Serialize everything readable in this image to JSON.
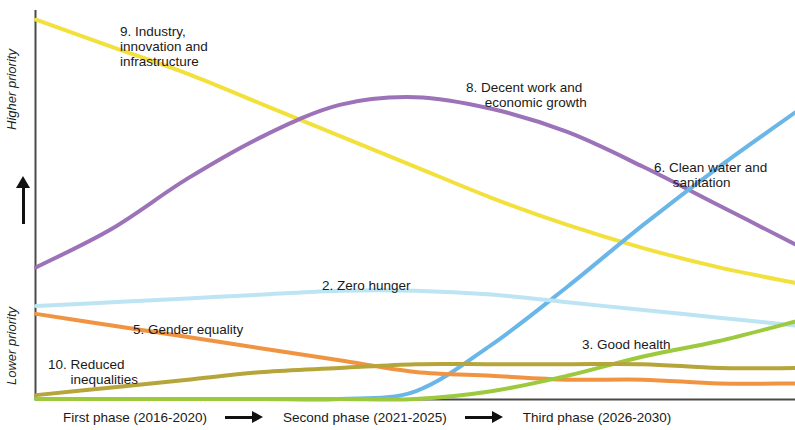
{
  "axes": {
    "y_high_label": "Higher priority",
    "y_low_label": "Lower priority",
    "y_arrow_icon": "up-arrow-icon",
    "phases": [
      {
        "label": "First phase (2016-2020)"
      },
      {
        "label": "Second phase (2021-2025)"
      },
      {
        "label": "Third phase (2026-2030)"
      }
    ],
    "phase_arrow_icon": "right-arrow-icon"
  },
  "labels": {
    "industry": "9. Industry,\ninnovation and\ninfrastructure",
    "decent_work": "8. Decent work and\n     economic growth",
    "clean_water": "6. Clean water and\n     sanitation",
    "zero_hunger": "2. Zero hunger",
    "gender_equality": "5. Gender equality",
    "good_health": "3. Good health",
    "reduced_inequalities": "10. Reduced\n      inequalities"
  },
  "chart_data": {
    "type": "line",
    "title": "",
    "xlabel": "",
    "ylabel": "Priority",
    "xlim": [
      0,
      100
    ],
    "ylim": [
      0,
      100
    ],
    "grid": false,
    "legend": "inline-annotations",
    "x_tick_labels": [
      "First phase (2016-2020)",
      "Second phase (2021-2025)",
      "Third phase (2026-2030)"
    ],
    "y_tick_labels": [
      "Lower priority",
      "Higher priority"
    ],
    "x": [
      0,
      10,
      20,
      30,
      40,
      50,
      60,
      70,
      80,
      90,
      100
    ],
    "series": [
      {
        "name": "9. Industry, innovation and infrastructure",
        "color": "#F2E13C",
        "values": [
          98,
          91,
          84,
          76,
          68,
          60,
          52,
          45,
          39,
          34,
          30
        ]
      },
      {
        "name": "8. Decent work and economic growth",
        "color": "#9C72B8",
        "values": [
          34,
          44,
          57,
          68,
          76,
          78,
          75,
          69,
          60,
          50,
          40
        ]
      },
      {
        "name": "6. Clean water and sanitation",
        "color": "#6BB6E8",
        "values": [
          0,
          0,
          0,
          0,
          0,
          2,
          14,
          29,
          45,
          60,
          74
        ]
      },
      {
        "name": "2. Zero hunger",
        "color": "#BCE4F2",
        "values": [
          24,
          25,
          26,
          27,
          28,
          28,
          27,
          25,
          23,
          21,
          19
        ]
      },
      {
        "name": "5. Gender equality",
        "color": "#F09442",
        "values": [
          22,
          19,
          16,
          13,
          10,
          7,
          6,
          5,
          5,
          4,
          4
        ]
      },
      {
        "name": "3. Good health",
        "color": "#9DC93C",
        "values": [
          0,
          0,
          0,
          0,
          0,
          0,
          2,
          6,
          11,
          15,
          20
        ]
      },
      {
        "name": "10. Reduced inequalities",
        "color": "#B6A53A",
        "values": [
          1,
          3,
          5,
          7,
          8,
          9,
          9,
          9,
          9,
          8,
          8
        ]
      }
    ]
  }
}
